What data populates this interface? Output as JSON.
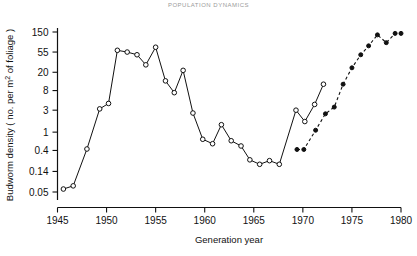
{
  "page": {
    "header_text": "POPULATION DYNAMICS"
  },
  "chart_data": {
    "type": "line",
    "title": "",
    "xlabel": "Generation year",
    "ylabel_prefix": "Budworm density ( no. per m",
    "ylabel_sup": "2",
    "ylabel_suffix": " of foliage )",
    "ylabel_full": "Budworm density ( no. per m2 of foliage )",
    "yscale": "log",
    "xlim": [
      1945,
      1980
    ],
    "ylim": [
      0.05,
      150
    ],
    "grid": false,
    "legend": "none",
    "xticks": [
      1945,
      1950,
      1955,
      1960,
      1965,
      1970,
      1975,
      1980
    ],
    "xtick_labels": [
      "1945",
      "1950",
      "1955",
      "1960",
      "1965",
      "1970",
      "1975",
      "1980"
    ],
    "yticks": [
      0.05,
      0.14,
      0.4,
      1,
      3,
      8,
      20,
      55,
      150
    ],
    "ytick_labels": [
      "0.05",
      "0.14",
      "0.4",
      "1",
      "3",
      "8",
      "20",
      "55",
      "150"
    ],
    "series": [
      {
        "name": "Observed budworm density",
        "marker": "open-circle",
        "linestyle": "solid",
        "color": "#111111",
        "x": [
          1945.6,
          1946.6,
          1948.0,
          1949.3,
          1950.2,
          1951.1,
          1952.1,
          1953.1,
          1954.0,
          1955.0,
          1956.0,
          1956.9,
          1957.8,
          1958.8,
          1959.8,
          1960.8,
          1961.7,
          1962.7,
          1963.7,
          1964.6,
          1965.6,
          1966.6,
          1967.6,
          1969.3,
          1970.2,
          1971.2,
          1972.1
        ],
        "y": [
          0.058,
          0.068,
          0.43,
          3.2,
          4.2,
          60.0,
          55.0,
          48.0,
          29.0,
          70.0,
          13.0,
          7.2,
          22.0,
          2.6,
          0.7,
          0.56,
          1.45,
          0.65,
          0.5,
          0.25,
          0.2,
          0.24,
          0.2,
          3.0,
          1.7,
          4.0,
          11.0
        ]
      },
      {
        "name": "Predicted budworm density",
        "marker": "filled-circle",
        "linestyle": "dashed",
        "color": "#111111",
        "x": [
          1969.4,
          1970.1,
          1971.3,
          1972.3,
          1973.2,
          1974.1,
          1975.0,
          1975.9,
          1976.7,
          1977.6,
          1978.5,
          1979.4,
          1980.0
        ],
        "y": [
          0.42,
          0.42,
          1.1,
          2.5,
          3.5,
          11.0,
          25.0,
          48.0,
          75.0,
          130.0,
          88.0,
          140.0,
          140.0
        ]
      }
    ]
  }
}
